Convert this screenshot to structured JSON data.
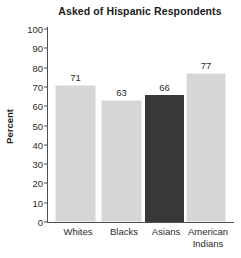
{
  "chart_data": {
    "type": "bar",
    "title": "Asked of Hispanic Respondents",
    "xlabel": "",
    "ylabel": "Percent",
    "ylim": [
      0,
      100
    ],
    "yticks": [
      0,
      10,
      20,
      30,
      40,
      50,
      60,
      70,
      80,
      90,
      100
    ],
    "grid": false,
    "legend": "none",
    "categories": [
      "Whites",
      "Blacks",
      "Asians",
      "American Indians"
    ],
    "category_lines": [
      [
        "Whites"
      ],
      [
        "Blacks"
      ],
      [
        "Asians"
      ],
      [
        "American",
        "Indians"
      ]
    ],
    "values": [
      71,
      63,
      66,
      77
    ],
    "value_labels": [
      "71",
      "63",
      "66",
      "77"
    ],
    "bar_colors": [
      "#d6d6d6",
      "#d6d6d6",
      "#383838",
      "#d6d6d6"
    ],
    "highlighted_category": "Asians",
    "colors": {
      "background": "#ffffff",
      "bar_light": "#d6d6d6",
      "bar_dark": "#383838",
      "axis": "#4d4d4d",
      "text": "#2b2b2b",
      "title_text": "#1a1a1a"
    }
  },
  "axis": {
    "y_tick_0": "0",
    "y_tick_10": "10",
    "y_tick_20": "20",
    "y_tick_30": "30",
    "y_tick_40": "40",
    "y_tick_50": "50",
    "y_tick_60": "60",
    "y_tick_70": "70",
    "y_tick_80": "80",
    "y_tick_90": "90",
    "y_tick_100": "100"
  }
}
